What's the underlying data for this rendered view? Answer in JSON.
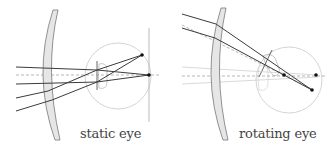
{
  "panels": [
    {
      "id": "static",
      "caption": "static eye"
    },
    {
      "id": "rotating",
      "caption": "rotating eye"
    }
  ],
  "colors": {
    "ray": "#404040",
    "axis_dash": "#888888",
    "eye_outline": "#c8c8c8",
    "lens_fill": "#e8e8e8",
    "lens_stroke": "#777777",
    "retina_line": "#999999",
    "point": "#111111",
    "caption": "#444444"
  }
}
